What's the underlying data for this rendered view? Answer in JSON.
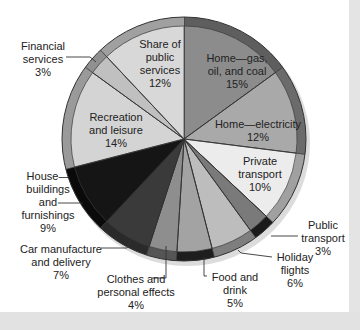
{
  "chart_data": {
    "type": "pie",
    "title": "",
    "unit": "%",
    "slices": [
      {
        "label": "Home—gas, oil, and coal",
        "value": 15,
        "color": "#8c8c8c",
        "rim": "#5e5e5e"
      },
      {
        "label": "Home—electricity",
        "value": 12,
        "color": "#a9a9a9",
        "rim": "#6b6b6b"
      },
      {
        "label": "Private transport",
        "value": 10,
        "color": "#ececec",
        "rim": "#a0a0a0"
      },
      {
        "label": "Public transport",
        "value": 3,
        "color": "#7a7a7a",
        "rim": "#1a1a1a"
      },
      {
        "label": "Holiday flights",
        "value": 6,
        "color": "#bdbdbd",
        "rim": "#7e7e7e"
      },
      {
        "label": "Food and drink",
        "value": 5,
        "color": "#a3a3a3",
        "rim": "#1e1e1e"
      },
      {
        "label": "Clothes and personal effects",
        "value": 4,
        "color": "#8e8e8e",
        "rim": "#555555"
      },
      {
        "label": "Car manufacture and delivery",
        "value": 7,
        "color": "#3a3a3a",
        "rim": "#2a2a2a"
      },
      {
        "label": "House buildings and furnishings",
        "value": 9,
        "color": "#151515",
        "rim": "#0a0a0a"
      },
      {
        "label": "Recreation and leisure",
        "value": 14,
        "color": "#d4d4d4",
        "rim": "#9a9a9a"
      },
      {
        "label": "Financial services",
        "value": 3,
        "color": "#c0c0c0",
        "rim": "#909090"
      },
      {
        "label": "Share of public services",
        "value": 12,
        "color": "#d8d8d8",
        "rim": "#a0a0a0"
      }
    ],
    "start_angle": "top",
    "direction": "clockwise",
    "legend": "none"
  },
  "labels": {
    "home_gas": "Home—gas,\noil, and coal\n15%",
    "home_electricity": "Home—electricity\n12%",
    "private_transport": "Private\ntransport\n10%",
    "public_transport": "Public\ntransport\n3%",
    "holiday_flights": "Holiday\nflights\n6%",
    "food_drink": "Food and\ndrink\n5%",
    "clothes": "Clothes and\npersonal effects\n4%",
    "car_manufacture": "Car manufacture\nand delivery\n7%",
    "house_buildings": "House—\nbuildings\nand\nfurnishings\n9%",
    "recreation": "Recreation\nand leisure\n14%",
    "financial": "Financial\nservices\n3%",
    "public_services": "Share of\npublic\nservices\n12%"
  }
}
